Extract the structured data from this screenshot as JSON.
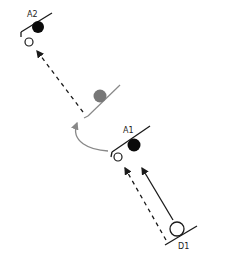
{
  "diagram": {
    "labels": {
      "a2": "A2",
      "a1": "A1",
      "d1": "D1"
    },
    "colors": {
      "line": "#1a1a1a",
      "filled_ball": "#0a0a0a",
      "gray_ball": "#777777",
      "gray_line": "#888888",
      "curve_arrow": "#888888",
      "background": "#ffffff"
    },
    "nodes": [
      {
        "id": "A2",
        "type": "surface-with-ball",
        "ball": "black"
      },
      {
        "id": "intermediate",
        "type": "surface-with-ball",
        "ball": "gray"
      },
      {
        "id": "A1",
        "type": "surface-with-ball",
        "ball": "black"
      },
      {
        "id": "D1",
        "type": "surface-with-ball",
        "ball": "hollow"
      }
    ],
    "arrows": [
      {
        "from": "D1",
        "to": "A1",
        "style": "solid"
      },
      {
        "from": "D1",
        "to": "A1-hollow",
        "style": "dashed"
      },
      {
        "from": "A1",
        "to": "intermediate",
        "style": "curved-gray"
      },
      {
        "from": "intermediate",
        "to": "A2-hollow",
        "style": "dashed"
      }
    ]
  }
}
